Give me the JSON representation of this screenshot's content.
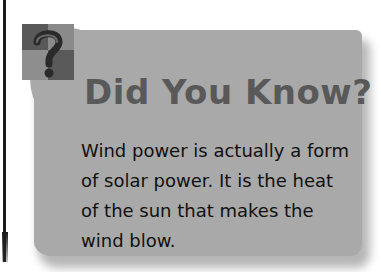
{
  "callout": {
    "title": "Did You Know?",
    "icon": "question-mark-icon",
    "body_lines": [
      "Wind power is actually a form",
      "of solar power. It is the heat",
      "of the sun that makes the",
      "wind blow."
    ],
    "colors": {
      "card_background": "#a9a9a9",
      "title": "#595959",
      "body_text": "#111111",
      "icon_dark": "#555555",
      "icon_light": "#8c8c8c"
    }
  }
}
